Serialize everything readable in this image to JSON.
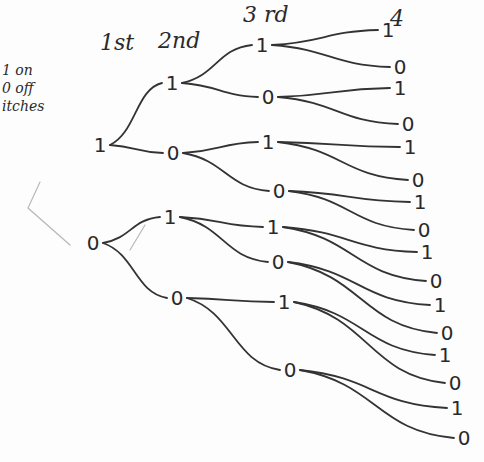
{
  "diagram": {
    "type": "tree",
    "headers": [
      {
        "label": "1st",
        "x": 100,
        "y": 50
      },
      {
        "label": "2nd",
        "x": 158,
        "y": 48
      },
      {
        "label": "3 rd",
        "x": 243,
        "y": 22
      },
      {
        "label": "4",
        "x": 390,
        "y": 26
      }
    ],
    "side_note": [
      "1 on",
      "0 off",
      "itches"
    ],
    "nodes": [
      {
        "id": "l1_1",
        "label": "1",
        "x": 100,
        "y": 145
      },
      {
        "id": "l1_0",
        "label": "0",
        "x": 93,
        "y": 243
      },
      {
        "id": "l2_11",
        "label": "1",
        "x": 172,
        "y": 83
      },
      {
        "id": "l2_10",
        "label": "0",
        "x": 173,
        "y": 153
      },
      {
        "id": "l2_01",
        "label": "1",
        "x": 170,
        "y": 217
      },
      {
        "id": "l2_00",
        "label": "0",
        "x": 177,
        "y": 298
      },
      {
        "id": "l3_111",
        "label": "1",
        "x": 262,
        "y": 45
      },
      {
        "id": "l3_110",
        "label": "0",
        "x": 268,
        "y": 97
      },
      {
        "id": "l3_101",
        "label": "1",
        "x": 268,
        "y": 142
      },
      {
        "id": "l3_100",
        "label": "0",
        "x": 279,
        "y": 191
      },
      {
        "id": "l3_011",
        "label": "1",
        "x": 273,
        "y": 227
      },
      {
        "id": "l3_010",
        "label": "0",
        "x": 278,
        "y": 262
      },
      {
        "id": "l3_001",
        "label": "1",
        "x": 284,
        "y": 302
      },
      {
        "id": "l3_000",
        "label": "0",
        "x": 290,
        "y": 370
      },
      {
        "id": "l4_1",
        "label": "1",
        "x": 388,
        "y": 30
      },
      {
        "id": "l4_2",
        "label": "0",
        "x": 400,
        "y": 67
      },
      {
        "id": "l4_3",
        "label": "1",
        "x": 400,
        "y": 88
      },
      {
        "id": "l4_4",
        "label": "0",
        "x": 408,
        "y": 124
      },
      {
        "id": "l4_5",
        "label": "1",
        "x": 410,
        "y": 147
      },
      {
        "id": "l4_6",
        "label": "0",
        "x": 418,
        "y": 180
      },
      {
        "id": "l4_7",
        "label": "1",
        "x": 420,
        "y": 202
      },
      {
        "id": "l4_8",
        "label": "0",
        "x": 424,
        "y": 230
      },
      {
        "id": "l4_9",
        "label": "1",
        "x": 427,
        "y": 252
      },
      {
        "id": "l4_10",
        "label": "0",
        "x": 436,
        "y": 281
      },
      {
        "id": "l4_11",
        "label": "1",
        "x": 440,
        "y": 305
      },
      {
        "id": "l4_12",
        "label": "0",
        "x": 447,
        "y": 333
      },
      {
        "id": "l4_13",
        "label": "1",
        "x": 445,
        "y": 355
      },
      {
        "id": "l4_14",
        "label": "0",
        "x": 455,
        "y": 383
      },
      {
        "id": "l4_15",
        "label": "1",
        "x": 457,
        "y": 408
      },
      {
        "id": "l4_16",
        "label": "0",
        "x": 464,
        "y": 438
      }
    ],
    "edges": [
      [
        "l1_1",
        "l2_11"
      ],
      [
        "l1_1",
        "l2_10"
      ],
      [
        "l1_0",
        "l2_01"
      ],
      [
        "l1_0",
        "l2_00"
      ],
      [
        "l2_11",
        "l3_111"
      ],
      [
        "l2_11",
        "l3_110"
      ],
      [
        "l2_10",
        "l3_101"
      ],
      [
        "l2_10",
        "l3_100"
      ],
      [
        "l2_01",
        "l3_011"
      ],
      [
        "l2_01",
        "l3_010"
      ],
      [
        "l2_00",
        "l3_001"
      ],
      [
        "l2_00",
        "l3_000"
      ],
      [
        "l3_111",
        "l4_1"
      ],
      [
        "l3_111",
        "l4_2"
      ],
      [
        "l3_110",
        "l4_3"
      ],
      [
        "l3_110",
        "l4_4"
      ],
      [
        "l3_101",
        "l4_5"
      ],
      [
        "l3_101",
        "l4_6"
      ],
      [
        "l3_100",
        "l4_7"
      ],
      [
        "l3_100",
        "l4_8"
      ],
      [
        "l3_011",
        "l4_9"
      ],
      [
        "l3_011",
        "l4_10"
      ],
      [
        "l3_010",
        "l4_11"
      ],
      [
        "l3_010",
        "l4_12"
      ],
      [
        "l3_001",
        "l4_13"
      ],
      [
        "l3_001",
        "l4_14"
      ],
      [
        "l3_000",
        "l4_15"
      ],
      [
        "l3_000",
        "l4_16"
      ]
    ],
    "colors": {
      "ink": "#333333",
      "faint": "#b8b8b8",
      "paper": "#fdfdfd"
    }
  }
}
